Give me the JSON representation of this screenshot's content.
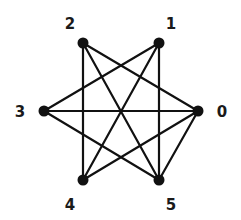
{
  "graph": {
    "type": "undirected",
    "colors": {
      "edge": "#111111",
      "node": "#111111",
      "label": "#1a1a1a",
      "background": "#ffffff"
    },
    "nodes": [
      {
        "id": "0",
        "label": "0",
        "x": 198,
        "y": 111,
        "label_x": 222,
        "label_y": 112
      },
      {
        "id": "1",
        "label": "1",
        "x": 159,
        "y": 43,
        "label_x": 171,
        "label_y": 24
      },
      {
        "id": "2",
        "label": "2",
        "x": 83,
        "y": 43,
        "label_x": 70,
        "label_y": 24
      },
      {
        "id": "3",
        "label": "3",
        "x": 44,
        "y": 111,
        "label_x": 20,
        "label_y": 112
      },
      {
        "id": "4",
        "label": "4",
        "x": 83,
        "y": 180,
        "label_x": 70,
        "label_y": 205
      },
      {
        "id": "5",
        "label": "5",
        "x": 159,
        "y": 180,
        "label_x": 171,
        "label_y": 205
      }
    ],
    "edges": [
      [
        "0",
        "2"
      ],
      [
        "0",
        "3"
      ],
      [
        "0",
        "4"
      ],
      [
        "0",
        "5"
      ],
      [
        "1",
        "3"
      ],
      [
        "1",
        "4"
      ],
      [
        "1",
        "5"
      ],
      [
        "2",
        "4"
      ],
      [
        "2",
        "5"
      ],
      [
        "3",
        "5"
      ]
    ]
  }
}
